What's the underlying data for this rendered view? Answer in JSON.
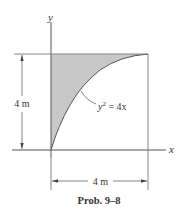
{
  "figure": {
    "axes": {
      "x_label": "x",
      "y_label": "y"
    },
    "curve": {
      "equation_lhs_var": "y",
      "equation_exp": "2",
      "equation_rhs": " = 4x",
      "equation_text": "y² = 4x"
    },
    "dimensions": {
      "height_label": "4 m",
      "width_label": "4 m"
    },
    "caption": "Prob. 9–8",
    "colors": {
      "shaded_region": "#c8c8c8",
      "lines": "#555555",
      "text": "#333333"
    }
  }
}
